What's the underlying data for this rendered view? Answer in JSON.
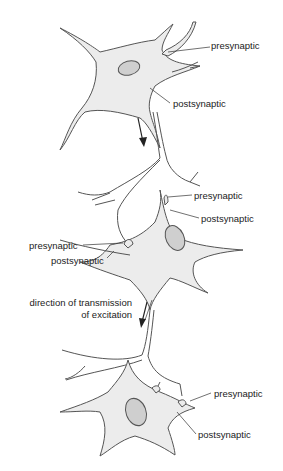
{
  "diagram": {
    "colors": {
      "cell_fill": "#ececec",
      "nucleus_fill": "#cfcfcf",
      "outline": "#555555",
      "text": "#222222",
      "arrow": "#222222"
    },
    "labels": {
      "top_presynaptic": "presynaptic",
      "top_postsynaptic": "postsynaptic",
      "mid_right_presynaptic": "presynaptic",
      "mid_right_postsynaptic": "postsynaptic",
      "mid_left_presynaptic": "presynaptic",
      "mid_left_postsynaptic": "postsynaptic",
      "direction_line1": "direction of transmission",
      "direction_line2": "of excitation",
      "bottom_presynaptic": "presynaptic",
      "bottom_postsynaptic": "postsynaptic"
    }
  }
}
